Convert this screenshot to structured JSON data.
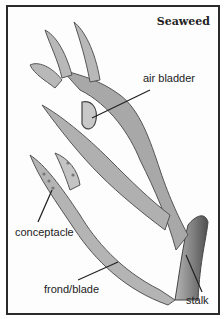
{
  "diagram": {
    "title": "Seaweed",
    "labels": {
      "air_bladder": "air bladder",
      "conceptacle": "conceptacle",
      "frond_blade": "frond/blade",
      "stalk": "stalk"
    },
    "colors": {
      "border": "#2a2a2a",
      "plant_light": "#c9c9c9",
      "plant_mid": "#9a9a9a",
      "plant_dark": "#5e5e5e",
      "text": "#222222"
    }
  }
}
